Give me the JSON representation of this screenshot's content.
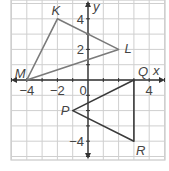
{
  "diagram": {
    "type": "coordinate-plane",
    "axes": {
      "x_label": "x",
      "y_label": "y",
      "x_ticks": [
        {
          "value": -4,
          "label": "−4"
        },
        {
          "value": -2,
          "label": "−2"
        },
        {
          "value": 0,
          "label": "0"
        },
        {
          "value": 4,
          "label": "4"
        }
      ],
      "y_ticks": [
        {
          "value": 4,
          "label": "4"
        },
        {
          "value": 2,
          "label": "2"
        },
        {
          "value": -4,
          "label": "−4"
        }
      ],
      "grid_range": {
        "x": [
          -5,
          5
        ],
        "y": [
          -5,
          5
        ]
      }
    },
    "triangles": [
      {
        "name": "KLM",
        "vertices": [
          {
            "label": "K",
            "x": -2,
            "y": 4
          },
          {
            "label": "L",
            "x": 2,
            "y": 2
          },
          {
            "label": "M",
            "x": -4,
            "y": 0
          }
        ]
      },
      {
        "name": "PQR",
        "vertices": [
          {
            "label": "P",
            "x": -1,
            "y": -2
          },
          {
            "label": "Q",
            "x": 3,
            "y": 0
          },
          {
            "label": "R",
            "x": 3,
            "y": -4
          }
        ]
      }
    ],
    "colors": {
      "grid": "#cfcfcf",
      "axis": "#333333",
      "triangle_klm": "#7a7a7a",
      "triangle_pqr": "#3a3a3a",
      "labels": "#444444",
      "border": "#bdbdbd"
    }
  }
}
